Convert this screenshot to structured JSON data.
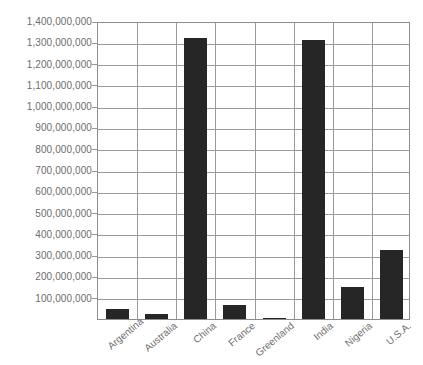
{
  "chart_data": {
    "type": "bar",
    "title": "",
    "xlabel": "",
    "ylabel": "",
    "categories": [
      "Argentina",
      "Australia",
      "China",
      "France",
      "Greenland",
      "India",
      "Nigeria",
      "U.S.A."
    ],
    "values": [
      45000000,
      25000000,
      1320000000,
      67000000,
      56000,
      1310000000,
      150000000,
      325000000
    ],
    "ylim": [
      0,
      1400000000
    ],
    "ytick_labels": [
      "1,400,000,000",
      "1,300,000,000",
      "1,200,000,000",
      "1,100,000,000",
      "1,000,000,000",
      "900,000,000",
      "800,000,000",
      "700,000,000",
      "600,000,000",
      "500,000,000",
      "400,000,000",
      "300,000,000",
      "200,000,000",
      "100,000,000"
    ],
    "ytick_values": [
      1400000000,
      1300000000,
      1200000000,
      1100000000,
      1000000000,
      900000000,
      800000000,
      700000000,
      600000000,
      500000000,
      400000000,
      300000000,
      200000000,
      100000000
    ],
    "grid": true,
    "legend": null,
    "bar_color": "#262626",
    "grid_color": "#9a9a9a",
    "axis_color": "#8d8d8d",
    "text_color": "#6d6d6d"
  }
}
